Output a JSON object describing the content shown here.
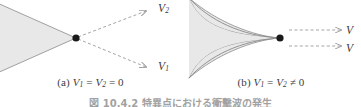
{
  "figure": {
    "caption": "図 10.4.2  特異点における衝撃波の発生",
    "background_color": "#ffffff",
    "shape_fill_color": "#e8e8e8",
    "shape_stroke_color": "#8a8a8a",
    "arrow_color": "#9a9a9a",
    "dot_color": "#1a1a1a",
    "text_color": "#3a3a3a"
  },
  "panels": [
    {
      "id": "a",
      "caption_prefix": "(a)",
      "caption_math": "V1 = V2 = 0",
      "caption_full": "(a) V₁ = V₂ = 0",
      "region_shape": "triangle",
      "vertex_dot": {
        "x": 76,
        "y": 38
      },
      "arrows": [
        {
          "name": "V2",
          "label": "V",
          "subscript": "2",
          "from": [
            76,
            38
          ],
          "to": [
            148,
            10
          ],
          "style": "dashed"
        },
        {
          "name": "V1",
          "label": "V",
          "subscript": "1",
          "from": [
            76,
            38
          ],
          "to": [
            148,
            68
          ],
          "style": "dashed"
        }
      ]
    },
    {
      "id": "b",
      "caption_prefix": "(b)",
      "caption_math": "V1 = V2 ≠ 0",
      "caption_full": "(b) V₁ = V₂ ≠ 0",
      "region_shape": "cusp",
      "vertex_dot": {
        "x": 99,
        "y": 38
      },
      "arrows": [
        {
          "name": "V2",
          "label": "V",
          "subscript": "",
          "from": [
            108,
            30
          ],
          "to": [
            162,
            30
          ],
          "style": "dashed"
        },
        {
          "name": "V1",
          "label": "V",
          "subscript": "",
          "from": [
            108,
            46
          ],
          "to": [
            162,
            46
          ],
          "style": "dashed"
        }
      ]
    }
  ]
}
